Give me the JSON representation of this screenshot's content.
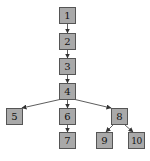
{
  "diagram": {
    "type": "tree",
    "node_fill": "#a9a9a9",
    "node_border": "#555555",
    "edge_color": "#333333",
    "nodes": [
      {
        "id": "1",
        "label": "1",
        "x": 59,
        "y": 7
      },
      {
        "id": "2",
        "label": "2",
        "x": 59,
        "y": 33
      },
      {
        "id": "3",
        "label": "3",
        "x": 59,
        "y": 58
      },
      {
        "id": "4",
        "label": "4",
        "x": 59,
        "y": 83
      },
      {
        "id": "5",
        "label": "5",
        "x": 6,
        "y": 108
      },
      {
        "id": "6",
        "label": "6",
        "x": 59,
        "y": 108
      },
      {
        "id": "7",
        "label": "7",
        "x": 59,
        "y": 132
      },
      {
        "id": "8",
        "label": "8",
        "x": 111,
        "y": 108
      },
      {
        "id": "9",
        "label": "9",
        "x": 96,
        "y": 132
      },
      {
        "id": "10",
        "label": "10",
        "x": 128,
        "y": 132
      }
    ],
    "edges": [
      {
        "from": "1",
        "to": "2"
      },
      {
        "from": "2",
        "to": "3"
      },
      {
        "from": "3",
        "to": "4"
      },
      {
        "from": "4",
        "to": "5"
      },
      {
        "from": "4",
        "to": "6"
      },
      {
        "from": "4",
        "to": "8"
      },
      {
        "from": "6",
        "to": "7"
      },
      {
        "from": "8",
        "to": "9"
      },
      {
        "from": "8",
        "to": "10"
      }
    ]
  }
}
